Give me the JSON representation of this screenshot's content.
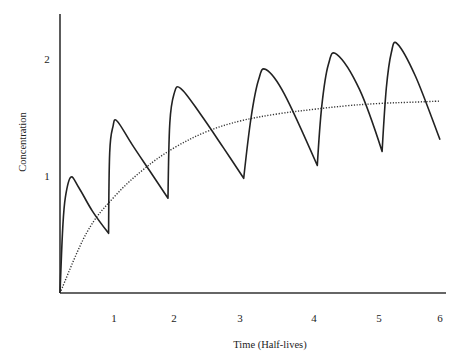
{
  "chart_data": {
    "type": "line",
    "title": "",
    "xlabel": "Time (Half-lives)",
    "ylabel": "Concentration",
    "xlim": [
      0,
      6
    ],
    "ylim": [
      0,
      2.3
    ],
    "grid": false,
    "legend": null,
    "x_ticks": [
      1,
      2,
      3,
      4,
      5,
      6
    ],
    "y_ticks": [
      1,
      2
    ],
    "series": [
      {
        "name": "Repeated-dose concentration",
        "style": "solid",
        "points": [
          {
            "x": 0.0,
            "y": 0.0
          },
          {
            "x": 0.05,
            "y": 0.55
          },
          {
            "x": 0.1,
            "y": 0.82
          },
          {
            "x": 0.2,
            "y": 0.99
          },
          {
            "x": 0.35,
            "y": 0.9
          },
          {
            "x": 0.6,
            "y": 0.7
          },
          {
            "x": 0.9,
            "y": 0.51
          },
          {
            "x": 0.92,
            "y": 1.2
          },
          {
            "x": 0.98,
            "y": 1.42
          },
          {
            "x": 1.05,
            "y": 1.47
          },
          {
            "x": 1.3,
            "y": 1.27
          },
          {
            "x": 1.6,
            "y": 1.04
          },
          {
            "x": 1.9,
            "y": 0.81
          },
          {
            "x": 1.93,
            "y": 1.45
          },
          {
            "x": 2.0,
            "y": 1.7
          },
          {
            "x": 2.1,
            "y": 1.75
          },
          {
            "x": 2.4,
            "y": 1.53
          },
          {
            "x": 2.75,
            "y": 1.24
          },
          {
            "x": 3.05,
            "y": 0.98
          },
          {
            "x": 3.15,
            "y": 1.5
          },
          {
            "x": 3.25,
            "y": 1.82
          },
          {
            "x": 3.35,
            "y": 1.91
          },
          {
            "x": 3.6,
            "y": 1.7
          },
          {
            "x": 4.05,
            "y": 1.09
          },
          {
            "x": 4.12,
            "y": 1.6
          },
          {
            "x": 4.22,
            "y": 1.95
          },
          {
            "x": 4.35,
            "y": 2.04
          },
          {
            "x": 4.7,
            "y": 1.74
          },
          {
            "x": 5.05,
            "y": 1.21
          },
          {
            "x": 5.12,
            "y": 1.75
          },
          {
            "x": 5.2,
            "y": 2.05
          },
          {
            "x": 5.3,
            "y": 2.13
          },
          {
            "x": 5.6,
            "y": 1.85
          },
          {
            "x": 6.0,
            "y": 1.31
          }
        ]
      },
      {
        "name": "Average / accumulation curve",
        "style": "dotted",
        "points": [
          {
            "x": 0.0,
            "y": 0.0
          },
          {
            "x": 0.5,
            "y": 0.52
          },
          {
            "x": 1.0,
            "y": 0.82
          },
          {
            "x": 1.5,
            "y": 1.06
          },
          {
            "x": 2.0,
            "y": 1.24
          },
          {
            "x": 2.5,
            "y": 1.38
          },
          {
            "x": 3.0,
            "y": 1.47
          },
          {
            "x": 3.5,
            "y": 1.53
          },
          {
            "x": 4.0,
            "y": 1.57
          },
          {
            "x": 4.5,
            "y": 1.6
          },
          {
            "x": 5.0,
            "y": 1.62
          },
          {
            "x": 5.5,
            "y": 1.63
          },
          {
            "x": 6.0,
            "y": 1.64
          }
        ]
      }
    ],
    "annotations": []
  },
  "layout": {
    "origin_px": [
      60,
      293
    ],
    "x_axis_end_px": 446,
    "y_axis_top_px": 14,
    "px_per_y_unit": 117,
    "x_tick_px": [
      60,
      114,
      174,
      240,
      314,
      379,
      440
    ],
    "dose_px": [
      60,
      110,
      170,
      241,
      310,
      385,
      446
    ],
    "line_color": "#222222"
  }
}
